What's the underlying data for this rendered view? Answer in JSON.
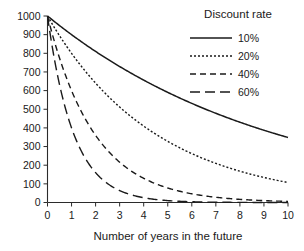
{
  "chart_data": {
    "type": "line",
    "title": "",
    "xlabel": "Number of years in the future",
    "ylabel": "",
    "xlim": [
      0,
      10
    ],
    "ylim": [
      0,
      1000
    ],
    "grid": false,
    "legend_position": "top-right",
    "legend_title": "Discount rate",
    "x": [
      0,
      1,
      2,
      3,
      4,
      5,
      6,
      7,
      8,
      9,
      10
    ],
    "xticks": [
      "0",
      "1",
      "2",
      "3",
      "4",
      "5",
      "6",
      "7",
      "8",
      "9",
      "10"
    ],
    "yticks": [
      "0",
      "100",
      "200",
      "300",
      "400",
      "500",
      "600",
      "700",
      "800",
      "900",
      "1000"
    ],
    "series": [
      {
        "name": "10%",
        "rate": 0.1,
        "style": "solid",
        "color": "#1a1a1a",
        "values": [
          1000,
          910,
          828,
          754,
          686,
          624,
          568,
          517,
          470,
          428,
          389
        ]
      },
      {
        "name": "20%",
        "rate": 0.2,
        "style": "dotted",
        "color": "#1a1a1a",
        "values": [
          1000,
          830,
          689,
          572,
          475,
          394,
          327,
          272,
          225,
          187,
          160
        ]
      },
      {
        "name": "40%",
        "rate": 0.4,
        "style": "dashed",
        "color": "#1a1a1a",
        "values": [
          1000,
          660,
          436,
          288,
          190,
          125,
          83,
          55,
          36,
          24,
          22
        ]
      },
      {
        "name": "60%",
        "rate": 0.6,
        "style": "long-dash",
        "color": "#1a1a1a",
        "values": [
          1000,
          480,
          250,
          140,
          80,
          46,
          27,
          16,
          10,
          6,
          4
        ]
      }
    ]
  },
  "axis": {
    "x_title": "Number of years in the future"
  },
  "legend": {
    "title": "Discount rate",
    "entries": [
      {
        "label": "10%"
      },
      {
        "label": "20%"
      },
      {
        "label": "40%"
      },
      {
        "label": "60%"
      }
    ]
  }
}
